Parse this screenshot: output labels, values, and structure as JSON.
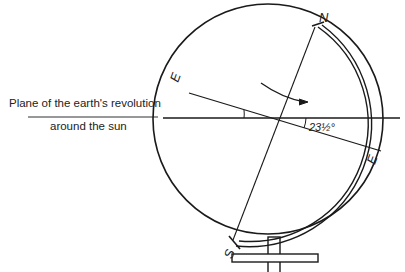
{
  "diagram": {
    "caption_line1": "Plane of the earth's revolution",
    "caption_line2": "around the sun",
    "north_label": "N",
    "south_label": "S",
    "equator_label_left": "E",
    "equator_label_right": "E",
    "tilt_angle_label": "23½°",
    "rotation_direction": "clockwise-arrow",
    "stroke_color": "#1a1a1a"
  }
}
